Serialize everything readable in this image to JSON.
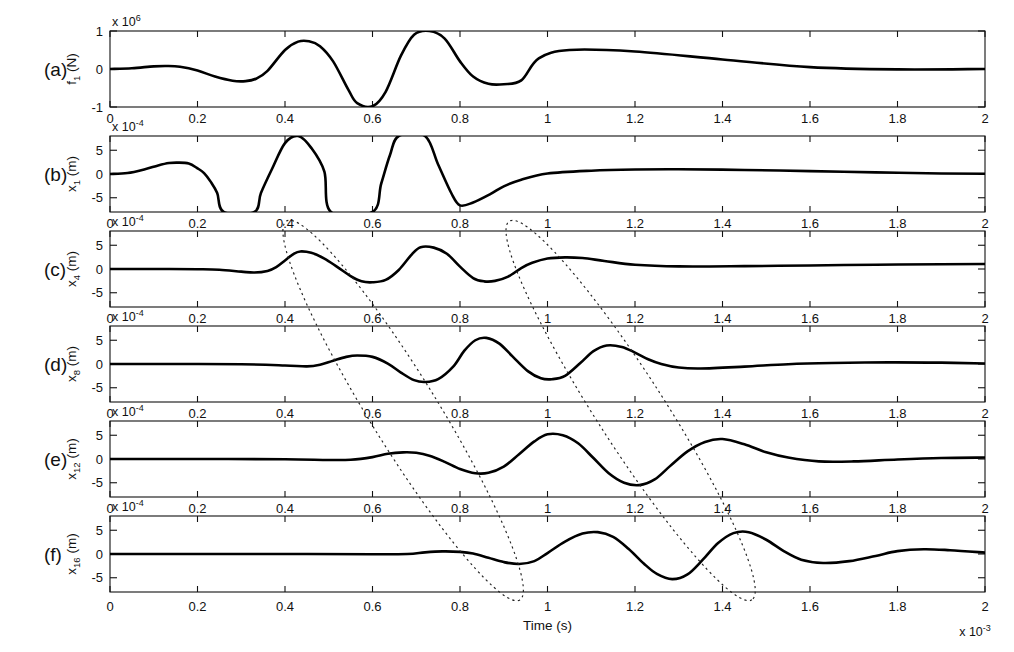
{
  "figure": {
    "background": "#ffffff",
    "curve_color": "#000000",
    "annotation_color": "#222222",
    "width": 1014,
    "height": 652
  },
  "axes": {
    "x_label": "Time (s)",
    "x_exponent_label": "x 10",
    "x_exponent_power": "-3",
    "x_min": 0,
    "x_max": 2,
    "x_ticks": [
      0,
      0.2,
      0.4,
      0.6,
      0.8,
      1,
      1.2,
      1.4,
      1.6,
      1.8,
      2
    ],
    "x_tick_labels": [
      "0",
      "0.2",
      "0.4",
      "0.6",
      "0.8",
      "1",
      "1.2",
      "1.4",
      "1.6",
      "1.8",
      "2"
    ]
  },
  "chart_data": {
    "type": "line",
    "title": "",
    "xlabel": "Time (s)",
    "xlabel_exponent": "x 10^-3",
    "xlim": [
      0,
      2
    ],
    "grid": false,
    "legend": "none",
    "shared_x_ticks": [
      0,
      0.2,
      0.4,
      0.6,
      0.8,
      1,
      1.2,
      1.4,
      1.6,
      1.8,
      2
    ],
    "panels": [
      {
        "letter": "(a)",
        "ylabel_base": "f",
        "ylabel_sub": "1",
        "ylabel_unit": "(N)",
        "y_exponent_label": "x 10",
        "y_exponent_power": "6",
        "ylim": [
          -1,
          1
        ],
        "y_ticks": [
          -1,
          0,
          1
        ],
        "y_tick_labels": [
          "-1",
          "0",
          "1"
        ],
        "series_name": "input force",
        "x": [
          0,
          0.05,
          0.1,
          0.13,
          0.16,
          0.2,
          0.24,
          0.28,
          0.31,
          0.335,
          0.36,
          0.4,
          0.43,
          0.455,
          0.48,
          0.51,
          0.545,
          0.565,
          0.6,
          0.63,
          0.665,
          0.695,
          0.73,
          0.765,
          0.8,
          0.83,
          0.865,
          0.9,
          0.94,
          0.98,
          1.05,
          1.2,
          1.4,
          1.6,
          1.8,
          2.0
        ],
        "y": [
          0.0,
          0.02,
          0.07,
          0.08,
          0.06,
          -0.04,
          -0.2,
          -0.31,
          -0.32,
          -0.25,
          -0.05,
          0.5,
          0.72,
          0.73,
          0.6,
          0.2,
          -0.55,
          -0.9,
          -0.98,
          -0.6,
          0.35,
          0.9,
          1.0,
          0.8,
          0.2,
          -0.2,
          -0.39,
          -0.4,
          -0.3,
          0.28,
          0.5,
          0.46,
          0.25,
          0.05,
          -0.01,
          0.0
        ]
      },
      {
        "letter": "(b)",
        "ylabel_base": "x",
        "ylabel_sub": "1",
        "ylabel_unit": "(m)",
        "y_exponent_label": "x 10",
        "y_exponent_power": "-4",
        "ylim": [
          -8,
          8
        ],
        "y_ticks": [
          -5,
          0,
          5
        ],
        "y_tick_labels": [
          "-5",
          "0",
          "5"
        ],
        "series_name": "displacement x1",
        "clipped": true,
        "x": [
          0,
          0.04,
          0.08,
          0.11,
          0.135,
          0.155,
          0.18,
          0.2,
          0.215,
          0.23,
          0.245,
          0.26,
          0.33,
          0.345,
          0.37,
          0.4,
          0.43,
          0.46,
          0.49,
          0.505,
          0.6,
          0.62,
          0.64,
          0.66,
          0.72,
          0.75,
          0.78,
          0.8,
          0.83,
          0.87,
          0.9,
          0.94,
          1.0,
          1.1,
          1.2,
          1.3,
          1.45,
          1.6,
          1.75,
          1.9,
          2.0
        ],
        "y": [
          0.0,
          0.2,
          1.0,
          1.8,
          2.3,
          2.4,
          2.2,
          1.2,
          0.2,
          -1.6,
          -4.0,
          -8.0,
          -8.0,
          -4.0,
          1.0,
          6.5,
          8.0,
          5.5,
          0.5,
          -8.0,
          -8.0,
          -2.0,
          4.0,
          8.0,
          8.0,
          2.0,
          -4.0,
          -6.6,
          -6.0,
          -4.2,
          -2.6,
          -1.2,
          0.1,
          0.7,
          0.95,
          1.0,
          0.85,
          0.6,
          0.35,
          0.12,
          0.05
        ]
      },
      {
        "letter": "(c)",
        "ylabel_base": "x",
        "ylabel_sub": "4",
        "ylabel_unit": "(m)",
        "y_exponent_label": "x 10",
        "y_exponent_power": "-4",
        "ylim": [
          -8,
          8
        ],
        "y_ticks": [
          -5,
          0,
          5
        ],
        "y_tick_labels": [
          "-5",
          "0",
          "5"
        ],
        "series_name": "displacement x4",
        "x": [
          0,
          0.1,
          0.2,
          0.25,
          0.3,
          0.33,
          0.36,
          0.38,
          0.4,
          0.42,
          0.435,
          0.46,
          0.49,
          0.52,
          0.55,
          0.575,
          0.6,
          0.63,
          0.66,
          0.69,
          0.71,
          0.74,
          0.77,
          0.8,
          0.83,
          0.855,
          0.88,
          0.91,
          0.94,
          0.965,
          1.0,
          1.04,
          1.08,
          1.13,
          1.2,
          1.3,
          1.45,
          1.6,
          1.75,
          1.9,
          2.0
        ],
        "y": [
          0.0,
          0.0,
          -0.05,
          -0.15,
          -0.55,
          -0.75,
          -0.4,
          0.4,
          1.8,
          3.2,
          3.7,
          3.4,
          2.2,
          0.4,
          -1.5,
          -2.6,
          -2.8,
          -2.3,
          -0.2,
          3.1,
          4.6,
          4.5,
          3.2,
          0.5,
          -1.9,
          -2.6,
          -2.5,
          -1.6,
          0.2,
          1.3,
          2.2,
          2.45,
          2.3,
          1.7,
          0.9,
          0.55,
          0.6,
          0.75,
          0.9,
          1.0,
          1.05
        ]
      },
      {
        "letter": "(d)",
        "ylabel_base": "x",
        "ylabel_sub": "8",
        "ylabel_unit": "(m)",
        "y_exponent_label": "x 10",
        "y_exponent_power": "-4",
        "ylim": [
          -8,
          8
        ],
        "y_ticks": [
          -5,
          0,
          5
        ],
        "y_tick_labels": [
          "-5",
          "0",
          "5"
        ],
        "series_name": "displacement x8",
        "x": [
          0,
          0.15,
          0.3,
          0.4,
          0.45,
          0.48,
          0.51,
          0.54,
          0.565,
          0.6,
          0.635,
          0.665,
          0.695,
          0.72,
          0.75,
          0.785,
          0.81,
          0.835,
          0.86,
          0.89,
          0.92,
          0.955,
          0.985,
          1.01,
          1.04,
          1.075,
          1.105,
          1.135,
          1.17,
          1.2,
          1.23,
          1.26,
          1.3,
          1.35,
          1.45,
          1.55,
          1.65,
          1.78,
          1.9,
          2.0
        ],
        "y": [
          0.0,
          0.0,
          -0.05,
          -0.3,
          -0.5,
          -0.15,
          0.7,
          1.5,
          1.8,
          1.5,
          0.1,
          -1.8,
          -3.4,
          -3.8,
          -3.2,
          -0.5,
          2.8,
          5.0,
          5.5,
          4.3,
          1.6,
          -1.5,
          -3.0,
          -3.2,
          -2.5,
          0.2,
          2.7,
          3.9,
          3.6,
          2.4,
          1.0,
          0.0,
          -0.75,
          -0.95,
          -0.55,
          -0.05,
          0.2,
          0.35,
          0.28,
          0.1
        ]
      },
      {
        "letter": "(e)",
        "ylabel_base": "x",
        "ylabel_sub": "12",
        "ylabel_unit": "(m)",
        "y_exponent_label": "x 10",
        "y_exponent_power": "-4",
        "ylim": [
          -8,
          8
        ],
        "y_ticks": [
          -5,
          0,
          5
        ],
        "y_tick_labels": [
          "-5",
          "0",
          "5"
        ],
        "series_name": "displacement x12",
        "x": [
          0,
          0.2,
          0.4,
          0.5,
          0.55,
          0.6,
          0.635,
          0.67,
          0.7,
          0.73,
          0.765,
          0.8,
          0.835,
          0.865,
          0.9,
          0.935,
          0.97,
          1.0,
          1.035,
          1.07,
          1.105,
          1.14,
          1.175,
          1.21,
          1.245,
          1.28,
          1.32,
          1.36,
          1.4,
          1.45,
          1.5,
          1.55,
          1.62,
          1.7,
          1.8,
          1.9,
          2.0
        ],
        "y": [
          0.0,
          0.0,
          -0.05,
          -0.2,
          -0.15,
          0.4,
          1.1,
          1.4,
          1.3,
          0.7,
          -0.6,
          -2.1,
          -3.0,
          -2.9,
          -1.6,
          1.0,
          3.7,
          5.2,
          5.0,
          3.3,
          0.2,
          -3.0,
          -5.0,
          -5.5,
          -4.3,
          -1.5,
          1.6,
          3.6,
          4.2,
          3.1,
          1.4,
          0.3,
          -0.5,
          -0.5,
          -0.1,
          0.2,
          0.3
        ]
      },
      {
        "letter": "(f)",
        "ylabel_base": "x",
        "ylabel_sub": "16",
        "ylabel_unit": "(m)",
        "y_exponent_label": "x 10",
        "y_exponent_power": "-4",
        "ylim": [
          -8,
          8
        ],
        "y_ticks": [
          -5,
          0,
          5
        ],
        "y_tick_labels": [
          "-5",
          "0",
          "5"
        ],
        "series_name": "displacement x16",
        "x": [
          0,
          0.2,
          0.45,
          0.6,
          0.68,
          0.72,
          0.76,
          0.8,
          0.83,
          0.865,
          0.9,
          0.935,
          0.97,
          1.0,
          1.04,
          1.08,
          1.115,
          1.15,
          1.185,
          1.22,
          1.25,
          1.285,
          1.32,
          1.355,
          1.39,
          1.425,
          1.46,
          1.5,
          1.54,
          1.58,
          1.63,
          1.69,
          1.75,
          1.8,
          1.86,
          1.92,
          2.0
        ],
        "y": [
          0.0,
          0.0,
          0.0,
          -0.05,
          0.0,
          0.35,
          0.55,
          0.45,
          0.1,
          -0.8,
          -1.7,
          -2.1,
          -1.5,
          0.2,
          2.6,
          4.3,
          4.6,
          3.6,
          1.1,
          -2.0,
          -4.2,
          -5.3,
          -4.3,
          -1.2,
          2.3,
          4.4,
          4.6,
          3.0,
          0.6,
          -1.2,
          -1.9,
          -1.5,
          -0.4,
          0.6,
          1.0,
          0.8,
          0.3
        ]
      }
    ],
    "annotations": [
      {
        "name": "wave-front-ellipse-1",
        "type": "dotted-ellipse",
        "description": "rotated dotted ellipse tracing the first wave arrival across panels c to f",
        "start_time": 0.42,
        "end_time": 0.92,
        "start_panel": "c",
        "end_panel": "f"
      },
      {
        "name": "wave-front-ellipse-2",
        "type": "dotted-ellipse",
        "description": "rotated dotted ellipse tracing the second wave arrival across panels c to f",
        "start_time": 0.93,
        "end_time": 1.45,
        "start_panel": "c",
        "end_panel": "f"
      }
    ]
  }
}
